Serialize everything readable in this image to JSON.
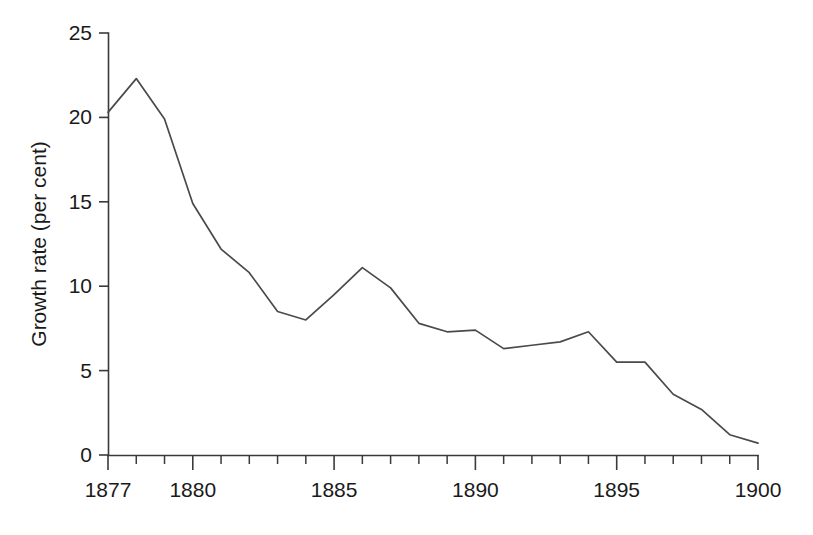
{
  "chart_data": {
    "type": "line",
    "title": "",
    "subtitle": "",
    "xlabel": "",
    "ylabel": "Growth rate (per cent)",
    "xlim": [
      1877,
      1900
    ],
    "ylim": [
      0,
      25
    ],
    "grid": false,
    "legend": null,
    "legend_position": "none",
    "x_tick_labels": [
      "1877",
      "1880",
      "1885",
      "1890",
      "1895",
      "1900"
    ],
    "x_tick_values": [
      1877,
      1880,
      1885,
      1890,
      1895,
      1900
    ],
    "x_minor_tick_interval": 1,
    "y_tick_labels": [
      "0",
      "5",
      "10",
      "15",
      "20",
      "25"
    ],
    "y_tick_values": [
      0,
      5,
      10,
      15,
      20,
      25
    ],
    "annotations": [],
    "series": [
      {
        "name": "Growth rate",
        "color": "#4a4a4a",
        "x": [
          1877,
          1878,
          1879,
          1880,
          1881,
          1882,
          1883,
          1884,
          1885,
          1886,
          1887,
          1888,
          1889,
          1890,
          1891,
          1892,
          1893,
          1894,
          1895,
          1896,
          1897,
          1898,
          1899,
          1900
        ],
        "values": [
          20.3,
          22.3,
          19.9,
          14.9,
          12.2,
          10.8,
          8.5,
          8.0,
          9.5,
          11.1,
          9.9,
          7.8,
          7.3,
          7.4,
          6.3,
          6.5,
          6.7,
          7.3,
          5.5,
          5.5,
          3.6,
          2.7,
          1.2,
          0.7
        ]
      }
    ]
  },
  "axes": {
    "y_axis_title": "Growth rate (per cent)"
  }
}
